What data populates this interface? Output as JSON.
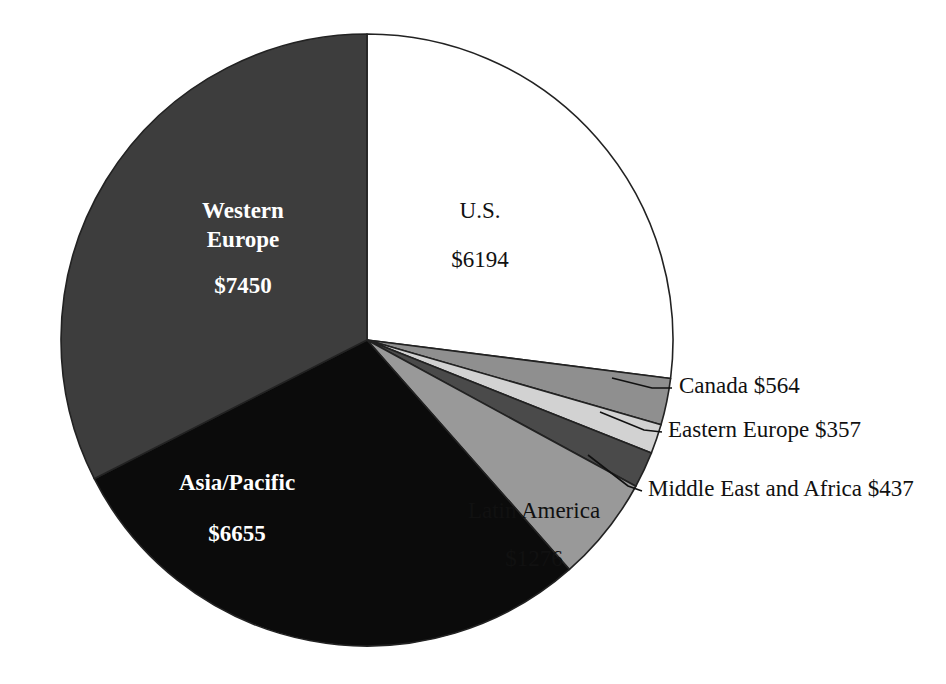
{
  "chart_data": {
    "type": "pie",
    "title": "",
    "subtitle": "",
    "xlabel": "",
    "ylabel": "",
    "legend_position": "none",
    "grid": false,
    "currency_prefix": "$",
    "total": 22933,
    "start_angle_deg": 0,
    "direction": "clockwise",
    "categories": [
      "U.S.",
      "Canada",
      "Eastern Europe",
      "Middle East and Africa",
      "Latin America",
      "Asia/Pacific",
      "Western Europe"
    ],
    "values": [
      6194,
      564,
      357,
      437,
      1276,
      6655,
      7450
    ],
    "slices": [
      {
        "name": "U.S.",
        "label": "U.S.",
        "value": 6194,
        "value_label": "$6194",
        "fill": "#ffffff",
        "text_color": "#111111",
        "font_weight": "normal",
        "placement": "inside",
        "label_x": 480,
        "label_y": 213,
        "value_x": 480,
        "value_y": 262,
        "font_size": 23
      },
      {
        "name": "Canada",
        "label": "Canada",
        "value": 564,
        "value_label": "$564",
        "fill": "#8f8f8f",
        "text_color": "#111111",
        "font_weight": "normal",
        "placement": "callout",
        "callout_text": "Canada   $564",
        "leader_from_x": 612,
        "leader_from_y": 378,
        "leader_mid_x": 652,
        "leader_mid_y": 388,
        "leader_to_x": 672,
        "leader_to_y": 388,
        "text_x": 679,
        "text_y": 388,
        "font_size": 23
      },
      {
        "name": "Eastern Europe",
        "label": "Eastern Europe",
        "value": 357,
        "value_label": "$357",
        "fill": "#d2d2d2",
        "text_color": "#111111",
        "font_weight": "normal",
        "placement": "callout",
        "callout_text": "Eastern Europe   $357",
        "leader_from_x": 600,
        "leader_from_y": 412,
        "leader_mid_x": 644,
        "leader_mid_y": 430,
        "leader_to_x": 662,
        "leader_to_y": 432,
        "text_x": 668,
        "text_y": 432,
        "font_size": 23
      },
      {
        "name": "Middle East and Africa",
        "label": "Middle East and Africa",
        "value": 437,
        "value_label": "$437",
        "fill": "#4a4a4a",
        "text_color": "#111111",
        "font_weight": "normal",
        "placement": "callout",
        "callout_text": "Middle East and Africa   $437",
        "leader_from_x": 588,
        "leader_from_y": 455,
        "leader_mid_x": 628,
        "leader_mid_y": 486,
        "leader_to_x": 642,
        "leader_to_y": 491,
        "text_x": 648,
        "text_y": 491,
        "font_size": 23
      },
      {
        "name": "Latin America",
        "label": "Latin America",
        "value": 1276,
        "value_label": "$1276",
        "fill": "#999999",
        "text_color": "#111111",
        "font_weight": "normal",
        "placement": "inside",
        "label_x": 534,
        "label_y": 513,
        "value_x": 534,
        "value_y": 561,
        "font_size": 23
      },
      {
        "name": "Asia/Pacific",
        "label": "Asia/Pacific",
        "value": 6655,
        "value_label": "$6655",
        "fill": "#0b0b0b",
        "text_color": "#ffffff",
        "font_weight": "bold",
        "placement": "inside",
        "label_x": 237,
        "label_y": 485,
        "value_x": 237,
        "value_y": 536,
        "font_size": 23
      },
      {
        "name": "Western Europe",
        "label": "Western Europe",
        "label_line1": "Western",
        "label_line2": "Europe",
        "value": 7450,
        "value_label": "$7450",
        "fill": "#3d3d3d",
        "text_color": "#ffffff",
        "font_weight": "bold",
        "placement": "inside",
        "label_x": 243,
        "label_y": 213,
        "label2_x": 243,
        "label2_y": 242,
        "value_x": 243,
        "value_y": 288,
        "font_size": 23
      }
    ],
    "geometry": {
      "center_x": 367,
      "center_y": 340,
      "radius": 306,
      "stroke": "#222222",
      "stroke_width": 1.6
    },
    "background": "#ffffff"
  }
}
